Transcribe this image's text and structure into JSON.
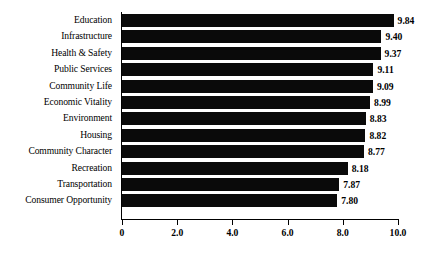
{
  "chart_data": {
    "type": "bar",
    "orientation": "horizontal",
    "title": "",
    "xlabel": "",
    "ylabel": "",
    "xlim": [
      0,
      10
    ],
    "grid": false,
    "legend": null,
    "xticks": [
      "0",
      "2.0",
      "4.0",
      "6.0",
      "8.0",
      "10.0"
    ],
    "xtick_values": [
      0,
      2,
      4,
      6,
      8,
      10
    ],
    "categories": [
      "Education",
      "Infrastructure",
      "Health & Safety",
      "Public Services",
      "Community Life",
      "Economic Vitality",
      "Environment",
      "Housing",
      "Community Character",
      "Recreation",
      "Transportation",
      "Consumer Opportunity"
    ],
    "values": [
      9.84,
      9.4,
      9.37,
      9.11,
      9.09,
      8.99,
      8.83,
      8.82,
      8.77,
      8.18,
      7.87,
      7.8
    ],
    "value_labels": [
      "9.84",
      "9.40",
      "9.37",
      "9.11",
      "9.09",
      "8.99",
      "8.83",
      "8.82",
      "8.77",
      "8.18",
      "7.87",
      "7.80"
    ],
    "bar_color": "#0a0a0a",
    "background_color": "#ffffff",
    "axis_color": "#000000"
  }
}
